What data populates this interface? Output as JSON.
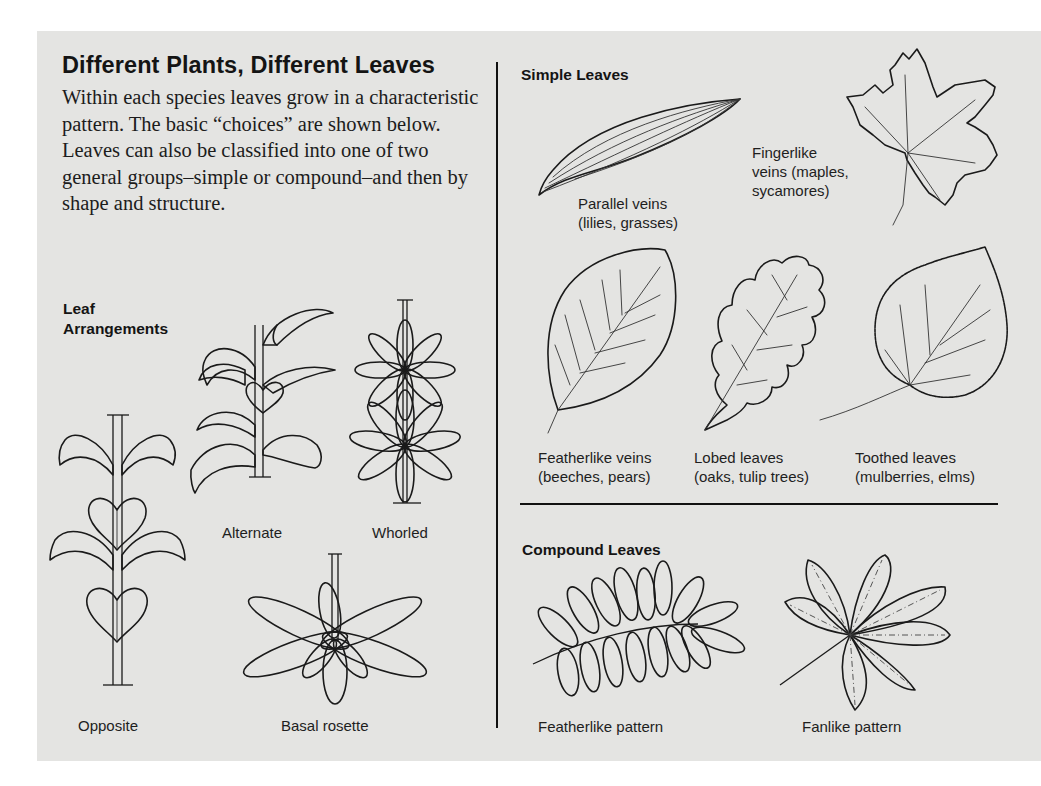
{
  "title": "Different Plants, Different Leaves",
  "intro": "Within each species leaves grow in a characteristic pattern. The basic “choices” are shown below. Leaves can also be classified into one of two general groups–simple or compound–and then by shape and structure.",
  "leaf_arrangements": {
    "heading_line1": "Leaf",
    "heading_line2": "Arrangements",
    "items": [
      {
        "label": "Opposite",
        "icon": "opposite-arrangement-icon"
      },
      {
        "label": "Alternate",
        "icon": "alternate-arrangement-icon"
      },
      {
        "label": "Whorled",
        "icon": "whorled-arrangement-icon"
      },
      {
        "label": "Basal rosette",
        "icon": "basal-rosette-icon"
      }
    ]
  },
  "simple_leaves": {
    "heading": "Simple Leaves",
    "items": [
      {
        "line1": "Parallel veins",
        "line2": "(lilies, grasses)",
        "icon": "parallel-vein-leaf-icon"
      },
      {
        "line1": "Fingerlike",
        "line2": "veins (maples,",
        "line3": "sycamores)",
        "icon": "palmate-vein-leaf-icon"
      },
      {
        "line1": "Featherlike veins",
        "line2": "(beeches, pears)",
        "icon": "pinnate-vein-leaf-icon"
      },
      {
        "line1": "Lobed leaves",
        "line2": "(oaks, tulip trees)",
        "icon": "lobed-leaf-icon"
      },
      {
        "line1": "Toothed leaves",
        "line2": "(mulberries, elms)",
        "icon": "toothed-leaf-icon"
      }
    ]
  },
  "compound_leaves": {
    "heading": "Compound Leaves",
    "items": [
      {
        "label": "Featherlike pattern",
        "icon": "pinnate-compound-leaf-icon"
      },
      {
        "label": "Fanlike pattern",
        "icon": "palmate-compound-leaf-icon"
      }
    ]
  },
  "colors": {
    "panel_background": "#e4e4e2",
    "page_background": "#ffffff",
    "ink": "#1a1a1a"
  }
}
